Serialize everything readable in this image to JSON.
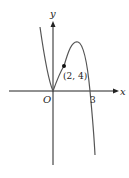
{
  "diagram": {
    "type": "function-graph",
    "axes": {
      "x_label": "x",
      "y_label": "y",
      "origin_label": "O"
    },
    "marked_x_intercept": "3",
    "point": {
      "label": "(2, 4)",
      "x": 2,
      "y": 4
    },
    "colors": {
      "axis": "#222222",
      "curve": "#555555",
      "point": "#111111"
    }
  }
}
